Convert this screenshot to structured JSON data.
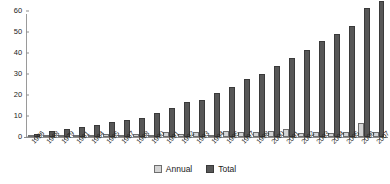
{
  "chart_data": {
    "type": "bar",
    "title": "",
    "subtitle": "",
    "xlabel": "",
    "ylabel": "",
    "ylim": [
      0,
      60
    ],
    "yticks": [
      0,
      10,
      20,
      30,
      40,
      50,
      60
    ],
    "grid": false,
    "legend_position": "bottom-center",
    "categories": [
      "1956",
      "1968",
      "1979",
      "1981",
      "1984",
      "1985",
      "1987",
      "1988",
      "1990",
      "1991",
      "1992",
      "1993",
      "1994",
      "1995",
      "1997",
      "1998",
      "2000",
      "2001",
      "2002",
      "2003",
      "2004",
      "2005",
      "2006",
      "2007"
    ],
    "series": [
      {
        "name": "Annual",
        "color": "#d4d4d4",
        "values": [
          0.6,
          0.8,
          0.9,
          0.6,
          1.0,
          1.2,
          1.0,
          1.4,
          0.8,
          2.2,
          1.4,
          2.4,
          1.0,
          2.8,
          2.4,
          2.6,
          3.0,
          3.6,
          1.8,
          2.2,
          2.0,
          2.2,
          6.6,
          2.2
        ]
      },
      {
        "name": "Total",
        "color": "#575757",
        "values": [
          1.5,
          3.0,
          3.8,
          4.6,
          5.6,
          7.0,
          8.0,
          9.0,
          11.2,
          13.6,
          16.6,
          17.4,
          21.0,
          24.0,
          27.4,
          29.8,
          33.6,
          37.4,
          41.6,
          45.8,
          49.2,
          53.0,
          61.2,
          65.0
        ]
      }
    ]
  },
  "legend": {
    "items": [
      {
        "label": "Annual",
        "swatch": "annual-swatch"
      },
      {
        "label": "Total",
        "swatch": "total-swatch"
      }
    ]
  },
  "axes": {
    "y_tick_labels": [
      "0",
      "10",
      "20",
      "30",
      "40",
      "50",
      "60"
    ]
  }
}
